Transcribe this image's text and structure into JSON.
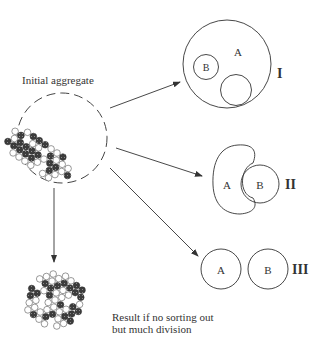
{
  "title": "Initial aggregate",
  "caption": {
    "line1": "Result if no sorting out",
    "line2": "but much division"
  },
  "outcomes": [
    {
      "numeral": "I",
      "outer_label": "A",
      "inner_label": "B",
      "description": "cell type B enclosed within A, plus an unlabeled inner region"
    },
    {
      "numeral": "II",
      "label_a": "A",
      "label_b": "B",
      "description": "A partially engulfs B"
    },
    {
      "numeral": "III",
      "label_a": "A",
      "label_b": "B",
      "description": "A and B fully separated"
    }
  ],
  "colors": {
    "line": "#333333",
    "dark_cell": "#3a3a3a",
    "light_cell": "#ffffff"
  }
}
